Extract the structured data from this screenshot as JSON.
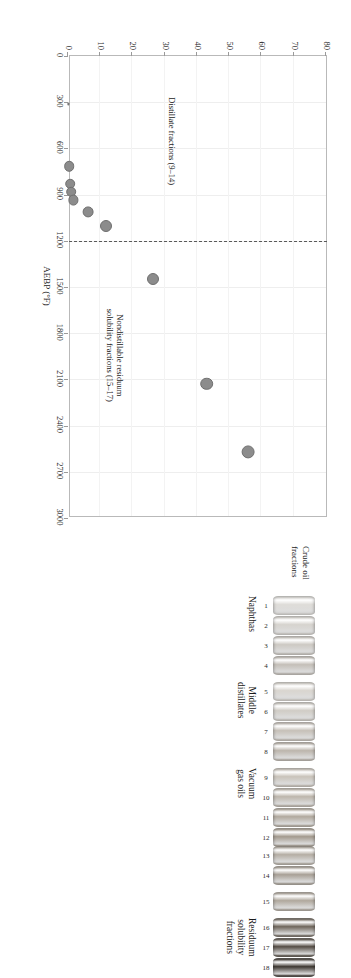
{
  "chart_data": {
    "type": "scatter",
    "title": "",
    "xlabel": "AEBP (°F)",
    "ylabel": "Micro carbon residue (wt.%)",
    "xlim": [
      0,
      3000
    ],
    "ylim": [
      0,
      80
    ],
    "xticks": [
      "0",
      "300",
      "600",
      "900",
      "1200",
      "1500",
      "1800",
      "2100",
      "2400",
      "2700",
      "3000"
    ],
    "yticks": [
      "0",
      "10",
      "20",
      "30",
      "40",
      "50",
      "60",
      "70",
      "80"
    ],
    "grid": true,
    "legend": "none",
    "marker_color": "#8c8c8c",
    "marker_edge_color": "#6f6f6f",
    "points": [
      {
        "label": "9",
        "x": 310,
        "y": 0.1,
        "r": 1.4
      },
      {
        "label": "10",
        "x": 715,
        "y": 0.3,
        "r": 4.2
      },
      {
        "label": "11",
        "x": 830,
        "y": 0.6,
        "r": 4.2
      },
      {
        "label": "12",
        "x": 880,
        "y": 1.0,
        "r": 4.2
      },
      {
        "label": "13",
        "x": 935,
        "y": 1.7,
        "r": 4.4
      },
      {
        "label": "14",
        "x": 1010,
        "y": 6.2,
        "r": 4.6
      },
      {
        "label": "15",
        "x": 1105,
        "y": 11.7,
        "r": 5.0
      },
      {
        "label": "16",
        "x": 1450,
        "y": 26.5,
        "r": 5.0
      },
      {
        "label": "17",
        "x": 2130,
        "y": 43.0,
        "r": 5.2
      },
      {
        "label": "18",
        "x": 2570,
        "y": 55.8,
        "r": 5.6
      }
    ],
    "divider": {
      "x": 1200,
      "style": "dashed",
      "color": "#5a5a5a"
    },
    "annotations": [
      {
        "name": "distillate-fractions-annotation",
        "text_line1": "Distillate fractions (9–14)",
        "text_line2": ""
      },
      {
        "name": "nondistillable-annotation",
        "text_line1": "Nondistillable residuum",
        "text_line2": "solubility fractions (15–17)"
      }
    ]
  },
  "vials": {
    "header_line1": "Crude oil",
    "header_line2": "fractions",
    "groups": [
      {
        "name": "naphthas",
        "label_line1": "Naphthas",
        "label_line2": "",
        "numbers": [
          "1",
          "2",
          "3",
          "4"
        ],
        "shades": [
          "#dedcd8",
          "#d6d3ce",
          "#cdc9c3",
          "#c4bfb8"
        ]
      },
      {
        "name": "middle-distillates",
        "label_line1": "Middle",
        "label_line2": "distillates",
        "numbers": [
          "5",
          "6",
          "7",
          "8"
        ],
        "shades": [
          "#d9d5cf",
          "#d0ccc5",
          "#c6c0b8",
          "#bcb5ac"
        ]
      },
      {
        "name": "vacuum-gas-oils",
        "label_line1": "Vacuum",
        "label_line2": "gas oils",
        "numbers": [
          "9",
          "10",
          "11",
          "12"
        ],
        "shades": [
          "#c9c3ba",
          "#bdb6ac",
          "#b1a99e",
          "#a39a8e"
        ]
      },
      {
        "name": "vacuum-gas-oils-heavy",
        "label_line1": "",
        "label_line2": "",
        "numbers": [
          "13",
          "14"
        ],
        "shades": [
          "#b5aea4",
          "#a8a096"
        ]
      },
      {
        "name": "residuum-single",
        "label_line1": "",
        "label_line2": "",
        "numbers": [
          "15"
        ],
        "shades": [
          "#b0a89d"
        ]
      },
      {
        "name": "residuum-solubility-fractions",
        "label_line1": "Residuum",
        "label_line2": "solubility",
        "label_line3": "fractions",
        "numbers": [
          "16",
          "17",
          "18"
        ],
        "shades": [
          "#6f665c",
          "#554d45",
          "#3e3832"
        ]
      }
    ]
  }
}
